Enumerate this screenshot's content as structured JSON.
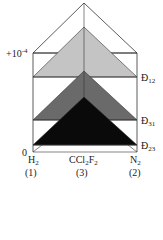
{
  "diagram": {
    "type": "ternary-prism-diffusivity",
    "y_axis": {
      "top_label": "+10",
      "top_exponent": "-4",
      "bottom_label": "0"
    },
    "layers": [
      {
        "name": "D12",
        "symbol": "Đ",
        "subscript": "12",
        "color": "#c4c4c4"
      },
      {
        "name": "D31",
        "symbol": "Đ",
        "subscript": "31",
        "color": "#6a6a6a"
      },
      {
        "name": "D23",
        "symbol": "Đ",
        "subscript": "23",
        "color": "#0a0a0a"
      }
    ],
    "components": [
      {
        "formula": "H",
        "sub": "2",
        "index": "(1)"
      },
      {
        "formula": "CCl",
        "sub1": "2",
        "mid": "F",
        "sub": "2",
        "index": "(3)"
      },
      {
        "formula": "N",
        "sub": "2",
        "index": "(2)"
      }
    ]
  }
}
